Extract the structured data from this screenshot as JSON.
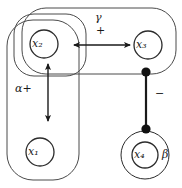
{
  "figure": {
    "type": "directed-graph-diagram",
    "background_color": "#ffffff",
    "stroke_color": "#2b2b2b",
    "nodes": [
      {
        "id": "x1",
        "label": "x₁",
        "cx": 40,
        "cy": 152,
        "r": 14,
        "double": false
      },
      {
        "id": "x2",
        "label": "x₂",
        "cx": 44,
        "cy": 44,
        "r": 14,
        "double": false
      },
      {
        "id": "x3",
        "label": "x₃",
        "cx": 148,
        "cy": 45,
        "r": 14,
        "double": false
      },
      {
        "id": "x4",
        "label": "x₄",
        "cx": 145,
        "cy": 155,
        "r": 13,
        "double": true,
        "outer_r": 24
      }
    ],
    "groups": [
      {
        "id": "outer-left",
        "x": 7,
        "y": 20,
        "w": 72,
        "h": 160,
        "rx": 26
      },
      {
        "id": "inner-top",
        "x": 14,
        "y": 14,
        "w": 72,
        "h": 62,
        "rx": 20
      },
      {
        "id": "outer-top",
        "x": 22,
        "y": 8,
        "w": 154,
        "h": 66,
        "rx": 24
      }
    ],
    "edges": [
      {
        "id": "edge-x2-x3",
        "kind": "double-arrow",
        "orientation": "horizontal",
        "from": "x2",
        "to": "x3",
        "x1": 72,
        "x2": 132,
        "y": 45,
        "labels": [
          "γ",
          "+"
        ]
      },
      {
        "id": "edge-x2-x1",
        "kind": "double-arrow",
        "orientation": "vertical",
        "from": "x2",
        "to": "x1",
        "x": 48,
        "y1": 62,
        "y2": 123,
        "labels": [
          "α+"
        ]
      },
      {
        "id": "edge-x3-x4",
        "kind": "ball-ended-bar",
        "orientation": "vertical",
        "from": "x3",
        "to": "x4",
        "x": 146,
        "y1": 72,
        "y2": 128,
        "labels": [
          "−"
        ]
      }
    ],
    "annotations": [
      {
        "id": "gamma-label",
        "text": "γ",
        "x": 95,
        "y": 18
      },
      {
        "id": "plus-label",
        "text": "+",
        "x": 96,
        "y": 30
      },
      {
        "id": "alpha-label",
        "text": "α+",
        "x": 16,
        "y": 88
      },
      {
        "id": "minus-label",
        "text": "−",
        "x": 154,
        "y": 94
      },
      {
        "id": "beta-label",
        "text": "β",
        "x": 161,
        "y": 153
      }
    ]
  }
}
